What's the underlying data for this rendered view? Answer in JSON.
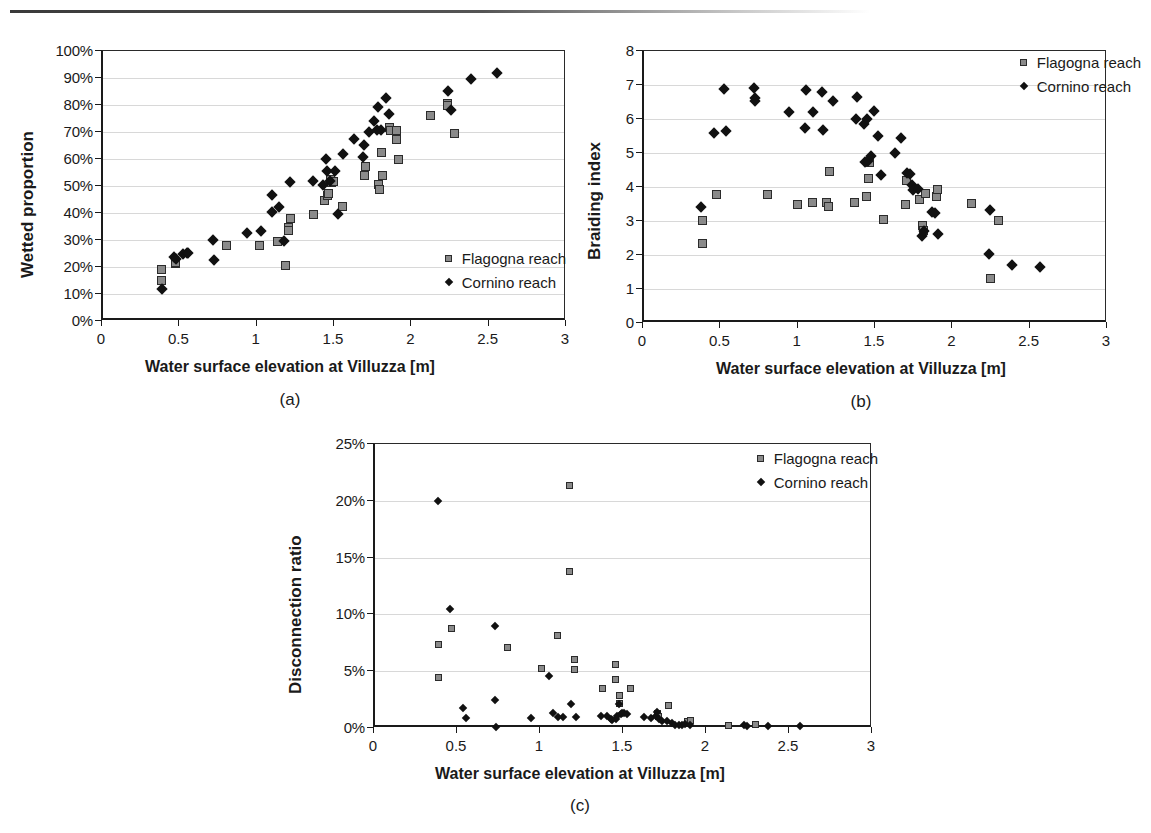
{
  "figure": {
    "shared_xlabel": "Water surface elevation at Villuzza [m]",
    "legend": {
      "flagogna": "Flagogna reach",
      "cornino": "Cornino reach",
      "flagogna_icon": "gray-square-marker",
      "cornino_icon": "black-diamond-marker"
    },
    "colors": {
      "flagogna_fill": "#8a8a8a",
      "flagogna_edge": "#2b2b2b",
      "cornino_fill": "#111111",
      "axis": "#1a1a1a",
      "grid": "#d8d8d8"
    }
  },
  "panels": [
    {
      "letter": "(a)",
      "caption": "(a)"
    },
    {
      "letter": "(b)",
      "caption": "(b)"
    },
    {
      "letter": "(c)",
      "caption": "(c)"
    }
  ],
  "chart_data": [
    {
      "type": "scatter",
      "panel": "(a)",
      "title": "",
      "xlabel": "Water surface elevation at Villuzza [m]",
      "ylabel": "Wetted proportion",
      "xlim": [
        0,
        3
      ],
      "ylim": [
        0,
        1
      ],
      "xticks": [
        0,
        0.5,
        1,
        1.5,
        2,
        2.5,
        3
      ],
      "xticklabels": [
        "0",
        "0.5",
        "1",
        "1.5",
        "2",
        "2.5",
        "3"
      ],
      "yticks": [
        0,
        0.1,
        0.2,
        0.3,
        0.4,
        0.5,
        0.6,
        0.7,
        0.8,
        0.9,
        1
      ],
      "yticklabels": [
        "0%",
        "10%",
        "20%",
        "30%",
        "40%",
        "50%",
        "60%",
        "70%",
        "80%",
        "90%",
        "100%"
      ],
      "grid": "horizontal",
      "legend_position": "bottom-right",
      "series": [
        {
          "name": "Flagogna reach",
          "marker": "square",
          "points": [
            [
              0.38,
              0.189
            ],
            [
              0.38,
              0.151
            ],
            [
              0.47,
              0.213
            ],
            [
              0.47,
              0.218
            ],
            [
              0.8,
              0.279
            ],
            [
              1.01,
              0.278
            ],
            [
              1.13,
              0.296
            ],
            [
              1.18,
              0.206
            ],
            [
              1.2,
              0.345
            ],
            [
              1.2,
              0.334
            ],
            [
              1.21,
              0.378
            ],
            [
              1.36,
              0.393
            ],
            [
              1.43,
              0.447
            ],
            [
              1.45,
              0.465
            ],
            [
              1.46,
              0.471
            ],
            [
              1.47,
              0.524
            ],
            [
              1.48,
              0.513
            ],
            [
              1.49,
              0.518
            ],
            [
              1.55,
              0.423
            ],
            [
              1.69,
              0.54
            ],
            [
              1.7,
              0.571
            ],
            [
              1.78,
              0.504
            ],
            [
              1.79,
              0.487
            ],
            [
              1.8,
              0.625
            ],
            [
              1.81,
              0.539
            ],
            [
              1.85,
              0.718
            ],
            [
              1.86,
              0.705
            ],
            [
              1.9,
              0.705
            ],
            [
              1.9,
              0.672
            ],
            [
              1.91,
              0.599
            ],
            [
              2.12,
              0.761
            ],
            [
              2.23,
              0.806
            ],
            [
              2.23,
              0.799
            ],
            [
              2.27,
              0.693
            ]
          ]
        },
        {
          "name": "Cornino reach",
          "marker": "diamond",
          "points": [
            [
              0.38,
              0.12
            ],
            [
              0.46,
              0.238
            ],
            [
              0.47,
              0.231
            ],
            [
              0.52,
              0.248
            ],
            [
              0.54,
              0.251
            ],
            [
              0.55,
              0.252
            ],
            [
              0.71,
              0.301
            ],
            [
              0.72,
              0.226
            ],
            [
              0.93,
              0.326
            ],
            [
              1.02,
              0.333
            ],
            [
              1.09,
              0.466
            ],
            [
              1.09,
              0.404
            ],
            [
              1.14,
              0.424
            ],
            [
              1.17,
              0.296
            ],
            [
              1.21,
              0.513
            ],
            [
              1.36,
              0.517
            ],
            [
              1.42,
              0.505
            ],
            [
              1.44,
              0.601
            ],
            [
              1.45,
              0.556
            ],
            [
              1.47,
              0.519
            ],
            [
              1.5,
              0.557
            ],
            [
              1.52,
              0.395
            ],
            [
              1.55,
              0.618
            ],
            [
              1.62,
              0.673
            ],
            [
              1.68,
              0.608
            ],
            [
              1.69,
              0.653
            ],
            [
              1.72,
              0.7
            ],
            [
              1.75,
              0.74
            ],
            [
              1.77,
              0.709
            ],
            [
              1.78,
              0.791
            ],
            [
              1.8,
              0.707
            ],
            [
              1.83,
              0.826
            ],
            [
              1.85,
              0.767
            ],
            [
              2.23,
              0.851
            ],
            [
              2.25,
              0.782
            ],
            [
              2.38,
              0.897
            ],
            [
              2.55,
              0.917
            ]
          ]
        }
      ]
    },
    {
      "type": "scatter",
      "panel": "(b)",
      "title": "",
      "xlabel": "Water surface elevation at Villuzza [m]",
      "ylabel": "Braiding index",
      "xlim": [
        0,
        3
      ],
      "ylim": [
        0,
        8
      ],
      "xticks": [
        0,
        0.5,
        1,
        1.5,
        2,
        2.5,
        3
      ],
      "xticklabels": [
        "0",
        "0.5",
        "1",
        "1.5",
        "2",
        "2.5",
        "3"
      ],
      "yticks": [
        0,
        1,
        2,
        3,
        4,
        5,
        6,
        7,
        8
      ],
      "yticklabels": [
        "0",
        "1",
        "2",
        "3",
        "4",
        "5",
        "6",
        "7",
        "8"
      ],
      "grid": "horizontal",
      "legend_position": "top-right",
      "series": [
        {
          "name": "Flagogna reach",
          "marker": "square",
          "points": [
            [
              0.38,
              3.02
            ],
            [
              0.38,
              2.33
            ],
            [
              0.47,
              3.77
            ],
            [
              0.8,
              3.79
            ],
            [
              0.99,
              3.48
            ],
            [
              1.09,
              3.54
            ],
            [
              1.18,
              3.55
            ],
            [
              1.19,
              3.44
            ],
            [
              1.2,
              4.46
            ],
            [
              1.36,
              3.55
            ],
            [
              1.44,
              3.73
            ],
            [
              1.45,
              4.24
            ],
            [
              1.46,
              4.72
            ],
            [
              1.55,
              3.05
            ],
            [
              1.69,
              3.5
            ],
            [
              1.7,
              4.18
            ],
            [
              1.78,
              3.64
            ],
            [
              1.8,
              2.86
            ],
            [
              1.81,
              2.72
            ],
            [
              1.82,
              3.82
            ],
            [
              1.89,
              3.72
            ],
            [
              1.9,
              3.92
            ],
            [
              2.12,
              3.51
            ],
            [
              2.29,
              3.02
            ],
            [
              2.24,
              1.32
            ]
          ]
        },
        {
          "name": "Cornino reach",
          "marker": "diamond",
          "points": [
            [
              0.37,
              3.4
            ],
            [
              0.45,
              5.58
            ],
            [
              0.52,
              6.89
            ],
            [
              0.53,
              5.65
            ],
            [
              0.71,
              6.9
            ],
            [
              0.72,
              6.62
            ],
            [
              0.72,
              6.54
            ],
            [
              0.94,
              6.22
            ],
            [
              1.05,
              6.85
            ],
            [
              1.09,
              6.22
            ],
            [
              1.04,
              5.74
            ],
            [
              1.15,
              6.79
            ],
            [
              1.16,
              5.67
            ],
            [
              1.22,
              6.54
            ],
            [
              1.37,
              5.99
            ],
            [
              1.38,
              6.66
            ],
            [
              1.42,
              5.86
            ],
            [
              1.43,
              4.74
            ],
            [
              1.44,
              5.99
            ],
            [
              1.45,
              4.77
            ],
            [
              1.47,
              4.92
            ],
            [
              1.49,
              6.23
            ],
            [
              1.51,
              5.49
            ],
            [
              1.53,
              4.35
            ],
            [
              1.62,
              5.0
            ],
            [
              1.66,
              5.44
            ],
            [
              1.7,
              4.42
            ],
            [
              1.72,
              4.37
            ],
            [
              1.73,
              4.07
            ],
            [
              1.74,
              3.92
            ],
            [
              1.77,
              3.94
            ],
            [
              1.8,
              2.57
            ],
            [
              1.81,
              2.7
            ],
            [
              1.86,
              3.27
            ],
            [
              1.88,
              3.24
            ],
            [
              1.9,
              2.63
            ],
            [
              2.24,
              3.33
            ],
            [
              2.23,
              2.02
            ],
            [
              2.38,
              1.71
            ],
            [
              2.56,
              1.66
            ]
          ]
        }
      ]
    },
    {
      "type": "scatter",
      "panel": "(c)",
      "title": "",
      "xlabel": "Water surface elevation at Villuzza [m]",
      "ylabel": "Disconnection ratio",
      "xlim": [
        0,
        3
      ],
      "ylim": [
        0,
        0.25
      ],
      "xticks": [
        0,
        0.5,
        1,
        1.5,
        2,
        2.5,
        3
      ],
      "xticklabels": [
        "0",
        "0.5",
        "1",
        "1.5",
        "2",
        "2.5",
        "3"
      ],
      "yticks": [
        0,
        0.05,
        0.1,
        0.15,
        0.2,
        0.25
      ],
      "yticklabels": [
        "0%",
        "5%",
        "10%",
        "15%",
        "20%",
        "25%"
      ],
      "grid": "horizontal",
      "legend_position": "top-right",
      "series": [
        {
          "name": "Flagogna reach",
          "marker": "square",
          "points": [
            [
              0.38,
              0.0735
            ],
            [
              0.38,
              0.0445
            ],
            [
              0.46,
              0.088
            ],
            [
              0.8,
              0.071
            ],
            [
              1.0,
              0.0527
            ],
            [
              1.17,
              0.2135
            ],
            [
              1.17,
              0.138
            ],
            [
              1.1,
              0.0812
            ],
            [
              1.2,
              0.06
            ],
            [
              1.2,
              0.0515
            ],
            [
              1.37,
              0.0352
            ],
            [
              1.45,
              0.056
            ],
            [
              1.45,
              0.0428
            ],
            [
              1.47,
              0.0282
            ],
            [
              1.47,
              0.0218
            ],
            [
              1.54,
              0.0347
            ],
            [
              1.7,
              0.0126
            ],
            [
              1.71,
              0.0105
            ],
            [
              1.77,
              0.02
            ],
            [
              1.88,
              0.0055
            ],
            [
              1.9,
              0.0062
            ],
            [
              2.13,
              0.0022
            ],
            [
              2.29,
              0.003
            ]
          ]
        },
        {
          "name": "Cornino reach",
          "marker": "diamond",
          "points": [
            [
              0.38,
              0.1998
            ],
            [
              0.45,
              0.1045
            ],
            [
              0.53,
              0.0172
            ],
            [
              0.55,
              0.0085
            ],
            [
              0.72,
              0.0898
            ],
            [
              0.72,
              0.025
            ],
            [
              0.73,
              0.0005
            ],
            [
              0.94,
              0.0089
            ],
            [
              1.05,
              0.0455
            ],
            [
              1.07,
              0.0128
            ],
            [
              1.1,
              0.01
            ],
            [
              1.13,
              0.0098
            ],
            [
              1.18,
              0.0215
            ],
            [
              1.21,
              0.01
            ],
            [
              1.36,
              0.011
            ],
            [
              1.4,
              0.0105
            ],
            [
              1.42,
              0.008
            ],
            [
              1.43,
              0.0068
            ],
            [
              1.45,
              0.0082
            ],
            [
              1.46,
              0.0105
            ],
            [
              1.47,
              0.0212
            ],
            [
              1.48,
              0.0122
            ],
            [
              1.49,
              0.013
            ],
            [
              1.5,
              0.0128
            ],
            [
              1.52,
              0.012
            ],
            [
              1.62,
              0.01
            ],
            [
              1.66,
              0.0092
            ],
            [
              1.69,
              0.0108
            ],
            [
              1.7,
              0.0138
            ],
            [
              1.71,
              0.0082
            ],
            [
              1.73,
              0.0065
            ],
            [
              1.76,
              0.006
            ],
            [
              1.79,
              0.0042
            ],
            [
              1.81,
              0.0028
            ],
            [
              1.83,
              0.003
            ],
            [
              1.85,
              0.0025
            ],
            [
              1.87,
              0.0032
            ],
            [
              1.9,
              0.0025
            ],
            [
              2.22,
              0.0025
            ],
            [
              2.24,
              0.0022
            ],
            [
              2.37,
              0.0022
            ],
            [
              2.56,
              0.002
            ]
          ]
        }
      ]
    }
  ]
}
